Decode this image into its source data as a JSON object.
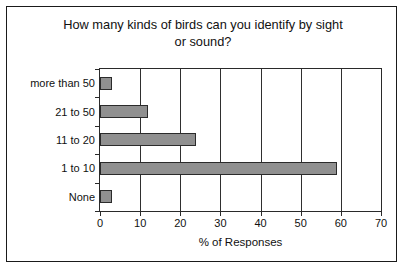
{
  "chart_data": {
    "type": "bar",
    "orientation": "horizontal",
    "title": "How many kinds of birds can you identify by sight\nor sound?",
    "categories": [
      "more than 50",
      "21 to 50",
      "11 to 20",
      "1 to 10",
      "None"
    ],
    "values": [
      3,
      12,
      24,
      59,
      3
    ],
    "xlabel": "% of Responses",
    "ylabel": "",
    "xlim": [
      0,
      70
    ],
    "xticks": [
      0,
      10,
      20,
      30,
      40,
      50,
      60,
      70
    ],
    "xtick_labels": [
      "0",
      "10",
      "20",
      "30",
      "40",
      "50",
      "60",
      "70"
    ],
    "grid": "vertical",
    "legend": "none",
    "colors": {
      "bar_fill": "#909090",
      "bar_outline": "#2b2b2b",
      "gridline": "#2f2f2f",
      "axis": "#2a2a2a",
      "text": "#111111",
      "background": "#ffffff",
      "frame": "#1a1a1a"
    }
  }
}
